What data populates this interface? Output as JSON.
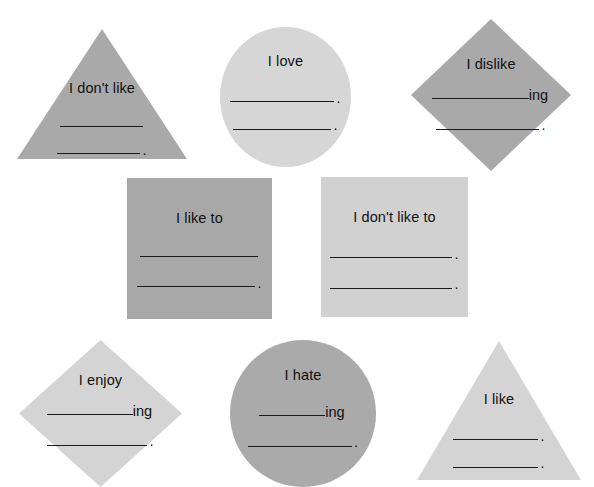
{
  "worksheet": {
    "background_color": "#ffffff",
    "ink_color": "#111111",
    "shade_dark": "#a9a9a9",
    "shade_light": "#d4d4d4",
    "blank_line_char": "_______________",
    "period": ".",
    "ing_suffix": "ing"
  },
  "shapes": [
    {
      "id": "dont-like",
      "shape": "triangle",
      "shade": "dark",
      "fill": "#a9a9a9",
      "prompt": "I don't like",
      "lines": [
        {
          "suffix": "",
          "period": ""
        },
        {
          "suffix": "",
          "period": "."
        }
      ]
    },
    {
      "id": "love",
      "shape": "circle",
      "shade": "light",
      "fill": "#d6d6d6",
      "prompt": "I love",
      "lines": [
        {
          "suffix": "",
          "period": "."
        },
        {
          "suffix": "",
          "period": "."
        }
      ]
    },
    {
      "id": "dislike",
      "shape": "diamond",
      "shade": "dark",
      "fill": "#a9a9a9",
      "prompt": "I dislike",
      "lines": [
        {
          "suffix": "ing",
          "period": ""
        },
        {
          "suffix": "",
          "period": "."
        }
      ]
    },
    {
      "id": "like-to",
      "shape": "square",
      "shade": "dark",
      "fill": "#a8a8a8",
      "prompt": "I like to",
      "lines": [
        {
          "suffix": "",
          "period": ""
        },
        {
          "suffix": "",
          "period": "."
        }
      ]
    },
    {
      "id": "dont-like-to",
      "shape": "square",
      "shade": "light",
      "fill": "#d1d1d1",
      "prompt": "I don't like to",
      "lines": [
        {
          "suffix": "",
          "period": "."
        },
        {
          "suffix": "",
          "period": "."
        }
      ]
    },
    {
      "id": "enjoy",
      "shape": "diamond",
      "shade": "light",
      "fill": "#d4d4d4",
      "prompt": "I enjoy",
      "lines": [
        {
          "suffix": "ing",
          "period": ""
        },
        {
          "suffix": "",
          "period": "."
        }
      ]
    },
    {
      "id": "hate",
      "shape": "circle",
      "shade": "dark",
      "fill": "#aaaaaa",
      "prompt": "I hate",
      "lines": [
        {
          "suffix": "ing",
          "period": ""
        },
        {
          "suffix": "",
          "period": "."
        }
      ]
    },
    {
      "id": "like",
      "shape": "triangle",
      "shade": "light",
      "fill": "#d4d4d4",
      "prompt": "I like",
      "lines": [
        {
          "suffix": "",
          "period": "."
        },
        {
          "suffix": "",
          "period": "."
        }
      ]
    }
  ]
}
